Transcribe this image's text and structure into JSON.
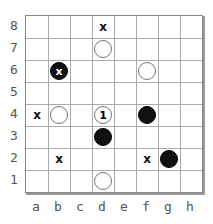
{
  "board": {
    "size": 8,
    "files": [
      "a",
      "b",
      "c",
      "d",
      "e",
      "f",
      "g",
      "h"
    ],
    "ranks": [
      "8",
      "7",
      "6",
      "5",
      "4",
      "3",
      "2",
      "1"
    ],
    "pieces": [
      {
        "square": "d7",
        "color": "white",
        "label": ""
      },
      {
        "square": "b6",
        "color": "black",
        "label": "x"
      },
      {
        "square": "f6",
        "color": "white",
        "label": ""
      },
      {
        "square": "b4",
        "color": "white",
        "label": ""
      },
      {
        "square": "d4",
        "color": "white",
        "label": "1"
      },
      {
        "square": "f4",
        "color": "black",
        "label": ""
      },
      {
        "square": "d3",
        "color": "black",
        "label": ""
      },
      {
        "square": "g2",
        "color": "black",
        "label": ""
      },
      {
        "square": "d1",
        "color": "white",
        "label": ""
      }
    ],
    "marks": [
      {
        "square": "d8",
        "label": "x"
      },
      {
        "square": "a4",
        "label": "x"
      },
      {
        "square": "b2",
        "label": "x"
      },
      {
        "square": "f2",
        "label": "x"
      }
    ]
  }
}
